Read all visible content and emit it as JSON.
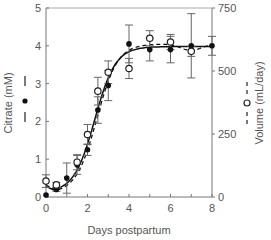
{
  "chart_data": {
    "type": "line",
    "title": "",
    "xlabel": "Days postpartum",
    "ylabel_left": "Citrate (mM)",
    "ylabel_right": "Volume (mL/day)",
    "xlim": [
      0,
      8
    ],
    "ylim_left": [
      0,
      5
    ],
    "ylim_right": [
      0,
      750
    ],
    "x_ticks": [
      0,
      2,
      4,
      6,
      8
    ],
    "y_ticks_left": [
      0,
      1,
      2,
      3,
      4,
      5
    ],
    "y_ticks_right": [
      0,
      250,
      500,
      750
    ],
    "grid": false,
    "legend": "inline axis-label markers: filled circle with solid line = Citrate; open circle with dashed line = Volume",
    "series": [
      {
        "name": "Citrate (mM)",
        "axis": "left",
        "marker": "filled-circle",
        "line": "solid",
        "points": [
          {
            "x": 0,
            "y": 0.05,
            "err": 0.0
          },
          {
            "x": 0.5,
            "y": 0.2,
            "err": 0.05
          },
          {
            "x": 1,
            "y": 0.5,
            "err": 0.4
          },
          {
            "x": 1.5,
            "y": 0.85,
            "err": 0.25
          },
          {
            "x": 2,
            "y": 1.25,
            "err": 0.15
          },
          {
            "x": 2.5,
            "y": 2.3,
            "err": 0.35
          },
          {
            "x": 3,
            "y": 2.95,
            "err": 0.4
          },
          {
            "x": 4,
            "y": 4.05,
            "err": 0.5
          },
          {
            "x": 5,
            "y": 3.9,
            "err": 0.3
          },
          {
            "x": 6,
            "y": 3.9,
            "err": 0.35
          },
          {
            "x": 7,
            "y": 4.0,
            "err": 0.85
          },
          {
            "x": 8,
            "y": 4.0,
            "err": 0.25
          }
        ]
      },
      {
        "name": "Volume (mL/day)",
        "axis": "right",
        "marker": "open-circle",
        "line": "dashed",
        "points": [
          {
            "x": 0,
            "y": 63,
            "err": 25
          },
          {
            "x": 0.5,
            "y": 48,
            "err": 10
          },
          {
            "x": 1.5,
            "y": 138,
            "err": 30
          },
          {
            "x": 2,
            "y": 248,
            "err": 40
          },
          {
            "x": 2.5,
            "y": 420,
            "err": 55
          },
          {
            "x": 3,
            "y": 495,
            "err": 45
          },
          {
            "x": 4,
            "y": 510,
            "err": 40
          },
          {
            "x": 5,
            "y": 630,
            "err": 30
          },
          {
            "x": 6,
            "y": 615,
            "err": 30
          },
          {
            "x": 7,
            "y": 578,
            "err": 20
          }
        ]
      }
    ]
  },
  "labels": {
    "x_axis": "Days postpartum",
    "y_left": "Citrate (mM)",
    "y_right": "Volume (mL/day)",
    "x_ticks": [
      "0",
      "2",
      "4",
      "6",
      "8"
    ],
    "y_left_ticks": [
      "0",
      "1",
      "2",
      "3",
      "4",
      "5"
    ],
    "y_right_ticks": [
      "0",
      "250",
      "500",
      "750"
    ]
  }
}
